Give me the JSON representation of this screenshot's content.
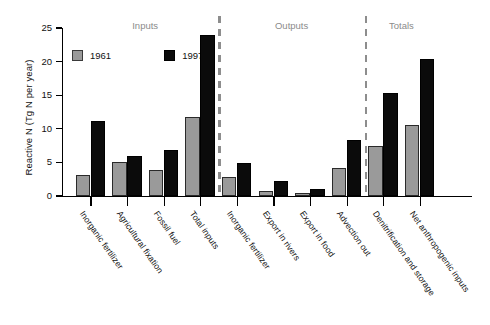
{
  "chart_data": {
    "type": "bar",
    "title": "",
    "xlabel": "",
    "ylabel": "Reactive N (Tg N per year)",
    "ylim": [
      0,
      25
    ],
    "yticks": [
      0,
      5,
      10,
      15,
      20,
      25
    ],
    "ytick_labels": [
      "0",
      "5",
      "10",
      "15",
      "20",
      "25"
    ],
    "grid": false,
    "legend_position": "top-left",
    "categories": [
      "Inorganic fertilizer",
      "Agricultural fixation",
      "Fossil fuel",
      "Total inputs",
      "Inorganic fertilizer",
      "Export in rivers",
      "Export in food",
      "Advection out",
      "Denitrification and storage",
      "Net anthropogenic inputs"
    ],
    "series": [
      {
        "name": "1961",
        "color": "#9a9a9a",
        "values": [
          3.2,
          5.0,
          3.8,
          11.8,
          2.8,
          0.7,
          0.5,
          4.2,
          7.4,
          10.5
        ]
      },
      {
        "name": "1997",
        "color": "#0b0b0b",
        "values": [
          11.2,
          5.9,
          6.9,
          24.0,
          4.9,
          2.2,
          1.1,
          8.4,
          15.3,
          20.4
        ]
      }
    ],
    "groups": [
      {
        "label": "Inputs",
        "start_index": 0,
        "end_index": 3
      },
      {
        "label": "Outputs",
        "start_index": 4,
        "end_index": 7
      },
      {
        "label": "Totals",
        "start_index": 8,
        "end_index": 9
      }
    ],
    "dividers": [
      {
        "after_index": 3
      },
      {
        "after_index": 7
      }
    ],
    "annotations": []
  },
  "legend": {
    "entries": [
      {
        "label": "1961",
        "swatch": "gray-square"
      },
      {
        "label": "1997",
        "swatch": "black-square"
      }
    ]
  }
}
